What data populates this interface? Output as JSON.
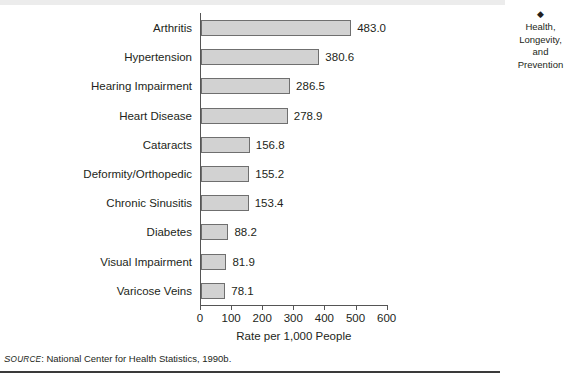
{
  "sidebar": {
    "diamond_icon": "◆",
    "marginal_title_lines": [
      "Health,",
      "Longevity,",
      "and",
      "Prevention"
    ]
  },
  "source": {
    "label": "Source",
    "label_caps": "S",
    "label_rest": "OURCE",
    "text": ": National Center for Health Statistics, 1990b."
  },
  "chart_data": {
    "type": "bar",
    "orientation": "horizontal",
    "title": "",
    "xlabel": "Rate per 1,000 People",
    "ylabel": "",
    "xlim": [
      0,
      600
    ],
    "xticks": [
      0,
      100,
      200,
      300,
      400,
      500,
      600
    ],
    "xtick_labels": [
      "0",
      "100",
      "200",
      "300",
      "400",
      "500",
      "600"
    ],
    "grid": false,
    "legend": false,
    "bar_fill": "#d2d2d2",
    "bar_edge": "#6f6f6f",
    "categories": [
      "Arthritis",
      "Hypertension",
      "Hearing Impairment",
      "Heart Disease",
      "Cataracts",
      "Deformity/Orthopedic",
      "Chronic Sinusitis",
      "Diabetes",
      "Visual Impairment",
      "Varicose Veins"
    ],
    "values": [
      483.0,
      380.6,
      286.5,
      278.9,
      156.8,
      155.2,
      153.4,
      88.2,
      81.9,
      78.1
    ],
    "value_labels": [
      "483.0",
      "380.6",
      "286.5",
      "278.9",
      "156.8",
      "155.2",
      "153.4",
      "88.2",
      "81.9",
      "78.1"
    ]
  }
}
